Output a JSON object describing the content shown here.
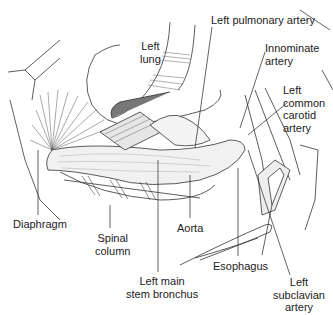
{
  "figure": {
    "labels": {
      "left_lung": [
        "Left",
        "lung"
      ],
      "left_pulmonary_artery": "Left pulmonary artery",
      "innominate_artery": [
        "Innominate",
        "artery"
      ],
      "left_common_carotid_artery": [
        "Left",
        "common",
        "carotid",
        "artery"
      ],
      "diaphragm": "Diaphragm",
      "spinal_column": [
        "Spinal",
        "column"
      ],
      "aorta": "Aorta",
      "left_main_stem_bronchus": [
        "Left main",
        "stem bronchus"
      ],
      "esophagus": "Esophagus",
      "left_subclavian_artery": [
        "Left",
        "subclavian",
        "artery"
      ]
    }
  }
}
